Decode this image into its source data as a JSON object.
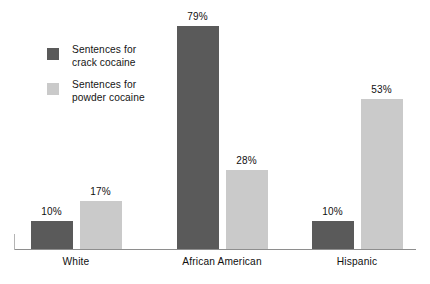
{
  "chart_data": {
    "type": "bar",
    "title": "",
    "subtitle": "",
    "xlabel": "",
    "ylabel": "",
    "ylim": [
      0,
      88
    ],
    "grid": false,
    "legend_position": "top-left",
    "value_suffix": "%",
    "categories": [
      "White",
      "African American",
      "Hispanic"
    ],
    "series": [
      {
        "name": "Sentences for crack cocaine",
        "name_line1": "Sentences for",
        "name_line2": "crack cocaine",
        "color": "#5a5a5a",
        "values": [
          10,
          79,
          10
        ],
        "labels": [
          "10%",
          "79%",
          "10%"
        ]
      },
      {
        "name": "Sentences for powder cocaine",
        "name_line1": "Sentences for",
        "name_line2": "powder cocaine",
        "color": "#cacaca",
        "values": [
          17,
          28,
          53
        ],
        "labels": [
          "17%",
          "28%",
          "53%"
        ]
      }
    ]
  },
  "axis": {
    "baseline_color": "#8e8e8e",
    "left_tick_color": "#b4b4b4"
  }
}
